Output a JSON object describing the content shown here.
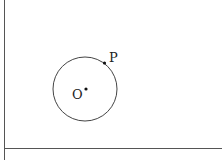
{
  "diagram": {
    "type": "geometry",
    "canvas": {
      "width": 222,
      "height": 160,
      "background": "#ffffff"
    },
    "stroke_color": "#555555",
    "text_color": "#222222",
    "frame": {
      "vertical_line": {
        "x": 4.5,
        "y1": 0,
        "y2": 160
      },
      "horizontal_line": {
        "y": 148.5,
        "x1": 4,
        "x2": 222
      }
    },
    "circle": {
      "cx": 85,
      "cy": 89,
      "r": 32
    },
    "points": [
      {
        "name": "O",
        "label": "O",
        "x": 86,
        "y": 89,
        "label_x": 72,
        "label_y": 99
      },
      {
        "name": "P",
        "label": "P",
        "x": 104.5,
        "y": 63,
        "label_x": 109,
        "label_y": 62
      }
    ]
  }
}
